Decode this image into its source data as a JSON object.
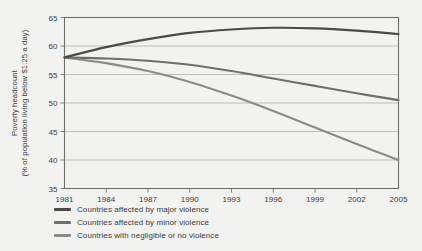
{
  "chart_data": {
    "type": "line",
    "title": "",
    "xlabel": "",
    "ylabel_line1": "Poverty headcount",
    "ylabel_line2": "(% of population living below $1.25 a day)",
    "xlim": [
      1981,
      2005
    ],
    "ylim": [
      35,
      65
    ],
    "grid": true,
    "legend_position": "below",
    "xticks": [
      1981,
      1984,
      1987,
      1990,
      1993,
      1996,
      1999,
      2002,
      2005
    ],
    "yticks": [
      35,
      40,
      45,
      50,
      55,
      60,
      65
    ],
    "x": [
      1981,
      1984,
      1987,
      1990,
      1993,
      1996,
      1999,
      2002,
      2005
    ],
    "series": [
      {
        "name": "Countries affected by major violence",
        "color": "#4a4a4a",
        "values": [
          58.0,
          59.8,
          61.2,
          62.3,
          62.9,
          63.2,
          63.1,
          62.7,
          62.1
        ]
      },
      {
        "name": "Countries affected by minor violence",
        "color": "#6e6e6e",
        "values": [
          58.0,
          57.8,
          57.4,
          56.7,
          55.6,
          54.3,
          53.0,
          51.7,
          50.5
        ]
      },
      {
        "name": "Countries with negligible or no violence",
        "color": "#8a8a8a",
        "values": [
          58.0,
          57.0,
          55.6,
          53.7,
          51.3,
          48.6,
          45.7,
          42.8,
          40.0
        ]
      }
    ]
  },
  "colors": {
    "background": "#f2f2f0",
    "frame": "#6f6f6d",
    "gridline": "#a7a7a5",
    "text": "#3b3b3b"
  }
}
